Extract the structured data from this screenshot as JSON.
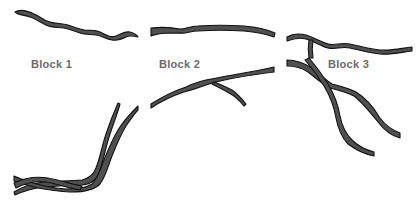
{
  "colors": {
    "background": "#ffffff",
    "path_fill": "#505050",
    "path_stroke": "#111111",
    "label": "#6b6b6b"
  },
  "blocks": [
    {
      "label": "Block 1",
      "label_x": 31,
      "label_y": 58
    },
    {
      "label": "Block 2",
      "label_x": 159,
      "label_y": 58
    },
    {
      "label": "Block 3",
      "label_x": 328,
      "label_y": 58
    }
  ]
}
